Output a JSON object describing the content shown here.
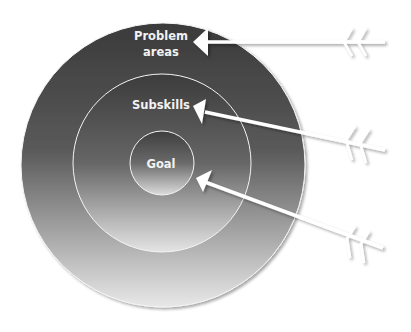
{
  "diagram": {
    "type": "target",
    "rings": [
      {
        "id": "outer",
        "label_lines": [
          "Problem",
          "areas"
        ]
      },
      {
        "id": "middle",
        "label_lines": [
          "Subskills"
        ]
      },
      {
        "id": "inner",
        "label_lines": [
          "Goal"
        ]
      }
    ],
    "arrows": [
      {
        "target": "Problem areas"
      },
      {
        "target": "Subskills"
      },
      {
        "target": "Goal"
      }
    ],
    "colors": {
      "ring_dark": "#3a3a3a",
      "ring_light": "#e6e6e6",
      "arrow": "#ffffff",
      "background": "#ffffff"
    }
  }
}
